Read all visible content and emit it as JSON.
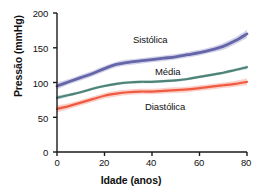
{
  "chart_data": {
    "type": "line",
    "title": "",
    "xlabel": "Idade (anos)",
    "ylabel": "Pressão (mmHg)",
    "xlim": [
      0,
      80
    ],
    "ylim": [
      0,
      200
    ],
    "xticks": [
      "0",
      "20",
      "40",
      "60",
      "80"
    ],
    "yticks": [
      "0",
      "50",
      "100",
      "150",
      "200"
    ],
    "grid": false,
    "legend_position": "inline-annotations",
    "x": [
      0,
      5,
      10,
      15,
      20,
      25,
      30,
      35,
      40,
      45,
      50,
      55,
      60,
      65,
      70,
      75,
      80
    ],
    "series": [
      {
        "name": "Sistólica",
        "color": "#6565a8",
        "band_color": "#c9c9e6",
        "values": [
          95,
          101,
          107,
          113,
          120,
          126,
          129,
          131,
          133,
          135,
          137,
          140,
          143,
          147,
          152,
          160,
          170
        ],
        "band_half_width": [
          5,
          4,
          4,
          4,
          4,
          4,
          4,
          4,
          4,
          4,
          4,
          4,
          4,
          4,
          5,
          5,
          6
        ]
      },
      {
        "name": "Média",
        "color": "#4d8378",
        "band_color": "#bcd6d0",
        "values": [
          78,
          82,
          86,
          91,
          95,
          98,
          100,
          101,
          101,
          102,
          103,
          105,
          108,
          111,
          114,
          118,
          122
        ],
        "band_half_width": [
          3,
          2,
          2,
          2,
          2,
          2,
          2,
          2,
          2,
          2,
          2,
          2,
          2,
          2,
          2,
          2,
          3
        ]
      },
      {
        "name": "Diastólica",
        "color": "#ef5a41",
        "band_color": "#fac6bc",
        "values": [
          62,
          66,
          71,
          76,
          81,
          84,
          86,
          87,
          87,
          88,
          89,
          90,
          92,
          94,
          96,
          98,
          101
        ],
        "band_half_width": [
          5,
          4,
          4,
          4,
          4,
          4,
          4,
          4,
          4,
          4,
          4,
          4,
          4,
          4,
          4,
          4,
          5
        ]
      }
    ],
    "annotations": [
      {
        "text": "Sistólica",
        "series": "Sistólica"
      },
      {
        "text": "Média",
        "series": "Média"
      },
      {
        "text": "Diastólica",
        "series": "Diastólica"
      }
    ]
  }
}
